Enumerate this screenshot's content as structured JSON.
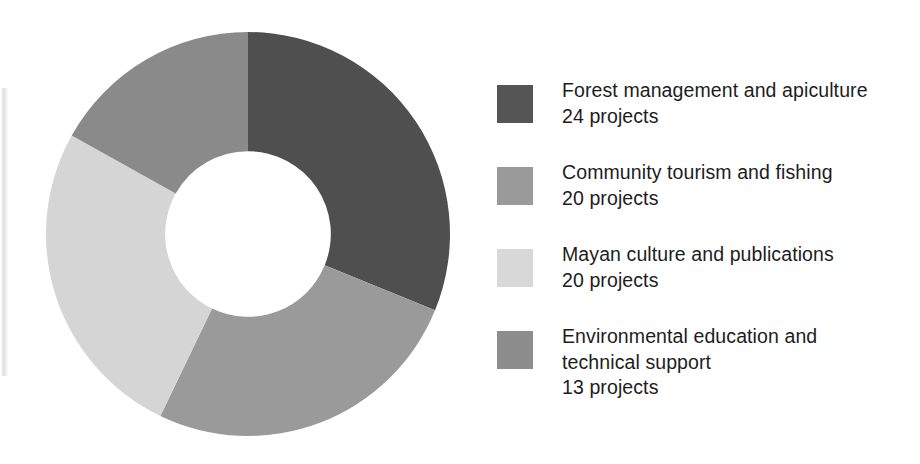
{
  "chart_data": {
    "type": "pie",
    "variant": "donut",
    "title": "",
    "subtitle": "",
    "xlabel": "",
    "ylabel": "",
    "unit": "projects",
    "total": 77,
    "hole_ratio": 0.41,
    "start_angle_deg": 0,
    "direction": "clockwise",
    "legend_position": "right",
    "grid": false,
    "categories": [
      "Forest management and apiculture",
      "Community tourism and fishing",
      "Mayan culture and publications",
      "Environmental education and technical support"
    ],
    "values": [
      24,
      20,
      20,
      13
    ],
    "colors": [
      "#4f4f4f",
      "#9a9a9a",
      "#d5d5d5",
      "#8a8a8a"
    ],
    "slices": [
      {
        "label": "Forest management and apiculture",
        "value": 24,
        "value_text": "24 projects",
        "percent": 31.2,
        "angle_deg": 112.2,
        "color": "#4f4f4f"
      },
      {
        "label": "Community tourism and fishing",
        "value": 20,
        "value_text": "20 projects",
        "percent": 26.0,
        "angle_deg": 93.5,
        "color": "#9a9a9a"
      },
      {
        "label": "Mayan culture and publications",
        "value": 20,
        "value_text": "20 projects",
        "percent": 26.0,
        "angle_deg": 93.5,
        "color": "#d5d5d5"
      },
      {
        "label": "Environmental education and technical support",
        "value": 13,
        "value_text": "13 projects",
        "percent": 16.9,
        "angle_deg": 60.8,
        "color": "#8a8a8a"
      }
    ]
  },
  "legend": {
    "items": [
      {
        "label": "Forest management and apiculture",
        "value_text": "24 projects",
        "color": "#555555"
      },
      {
        "label": "Community tourism and fishing",
        "value_text": "20 projects",
        "color": "#9a9a9a"
      },
      {
        "label": "Mayan culture and publications",
        "value_text": "20 projects",
        "color": "#d8d8d8"
      },
      {
        "label": "Environmental education and\ntechnical support",
        "value_text": "13 projects",
        "color": "#8d8d8d"
      }
    ]
  }
}
